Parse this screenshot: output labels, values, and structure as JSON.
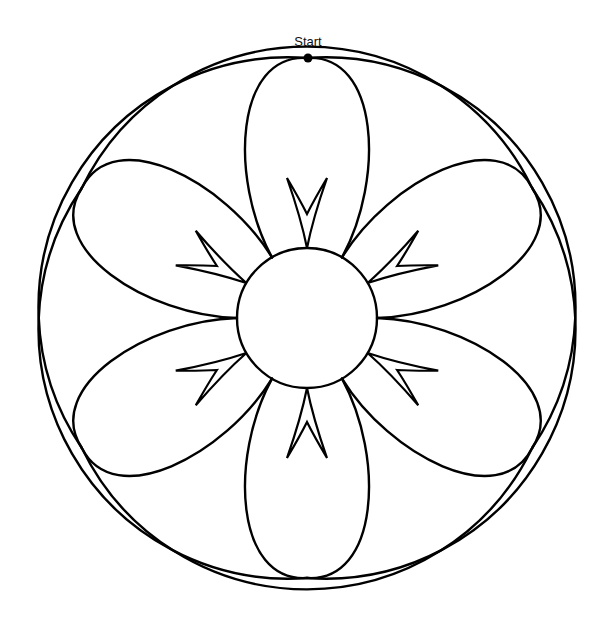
{
  "diagram": {
    "type": "continuous-line flower drawing path",
    "center": {
      "x": 307,
      "y": 318
    },
    "center_circle_radius": 70,
    "petal_count": 6,
    "petal_tip_radius": 260,
    "outer_arc_radius": 250,
    "arrow_count": 6,
    "start_point": {
      "label": "Start",
      "x": 308,
      "y": 58
    },
    "stroke_color": "#000000",
    "background_color": "#ffffff"
  }
}
